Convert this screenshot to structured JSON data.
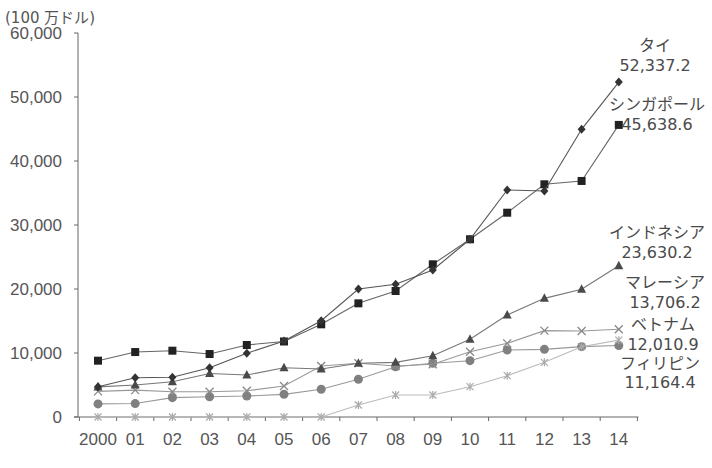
{
  "chart_data": {
    "type": "line",
    "title": "",
    "xlabel": "",
    "ylabel": "(100 万ドル)",
    "unit_label": "(100 万ドル)",
    "categories": [
      "2000",
      "01",
      "02",
      "03",
      "04",
      "05",
      "06",
      "07",
      "08",
      "09",
      "10",
      "11",
      "12",
      "13",
      "14"
    ],
    "y_ticks": [
      0,
      10000,
      20000,
      30000,
      40000,
      50000,
      60000
    ],
    "y_tick_labels": [
      "0",
      "10,000",
      "20,000",
      "30,000",
      "40,000",
      "50,000",
      "60,000"
    ],
    "ylim": [
      0,
      60000
    ],
    "grid": false,
    "legend_position": "inline-right-end-labels",
    "series": [
      {
        "name": "タイ",
        "end_label": "52,337.2",
        "marker": "diamond",
        "color": "#333333",
        "line_color": "#555555",
        "values": [
          4740,
          6140,
          6200,
          7700,
          9950,
          11870,
          15050,
          20000,
          20730,
          22970,
          27770,
          35470,
          35310,
          44950,
          52337.2
        ]
      },
      {
        "name": "シンガポール",
        "end_label": "45,638.6",
        "marker": "square",
        "color": "#222222",
        "line_color": "#666666",
        "values": [
          8800,
          10150,
          10360,
          9840,
          11250,
          11800,
          14480,
          17760,
          19690,
          23860,
          27770,
          31920,
          36360,
          36880,
          45638.6
        ]
      },
      {
        "name": "インドネシア",
        "end_label": "23,630.2",
        "marker": "triangle",
        "color": "#4a4a4a",
        "line_color": "#777777",
        "values": [
          4700,
          5000,
          5500,
          6800,
          6560,
          7700,
          7500,
          8390,
          8540,
          9580,
          12140,
          15940,
          18540,
          19950,
          23630.2
        ]
      },
      {
        "name": "マレーシア",
        "end_label": "13,706.2",
        "marker": "cross",
        "color": "#888888",
        "line_color": "#999999",
        "values": [
          4000,
          4200,
          3950,
          3950,
          4100,
          4840,
          7970,
          8390,
          7970,
          8230,
          10200,
          11510,
          13490,
          13440,
          13706.2
        ]
      },
      {
        "name": "ベトナム",
        "end_label": "12,010.9",
        "marker": "asterisk",
        "color": "#aaaaaa",
        "line_color": "#bbbbbb",
        "values": [
          0,
          0,
          0,
          0,
          0,
          0,
          0,
          1870,
          3440,
          3440,
          4740,
          6460,
          8540,
          10990,
          12010.9
        ]
      },
      {
        "name": "フィリピン",
        "end_label": "11,164.4",
        "marker": "circle",
        "color": "#808080",
        "line_color": "#999999",
        "values": [
          2050,
          2100,
          3020,
          3170,
          3280,
          3540,
          4330,
          5890,
          7860,
          8390,
          8800,
          10470,
          10570,
          10990,
          11164.4
        ]
      }
    ]
  }
}
